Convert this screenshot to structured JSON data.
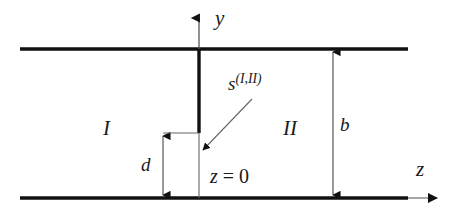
{
  "diagram": {
    "colors": {
      "plate": "#111111",
      "septum": "#111111",
      "thin_line": "#555555",
      "text": "#1a1a1a",
      "background": "#ffffff"
    },
    "axes": {
      "y_axis_label": "y",
      "z_axis_label": "z",
      "origin_label_prefix": "z",
      "origin_label_equals": " = ",
      "origin_label_value": "0",
      "origin_label_full": "z = 0"
    },
    "regions": [
      {
        "name": "region-one",
        "label": "I"
      },
      {
        "name": "region-two",
        "label": "II"
      }
    ],
    "dimensions": [
      {
        "name": "plate-separation",
        "label": "b"
      },
      {
        "name": "septum-gap",
        "label": "d"
      }
    ],
    "source": {
      "symbol": "s",
      "superscript": "(I,II)",
      "full": "s^(I,II)"
    }
  }
}
